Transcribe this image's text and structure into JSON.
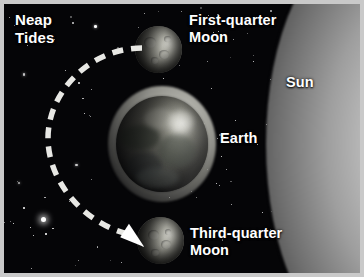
{
  "figure": {
    "title": "Neap Tides",
    "border_color": "#c9c9c9",
    "background_color": "#050507"
  },
  "labels": {
    "neap_tides": "Neap\nTides",
    "first_quarter_moon": "First-quarter\nMoon",
    "sun": "Sun",
    "earth": "Earth",
    "third_quarter_moon": "Third-quarter\nMoon",
    "text_color": "#ffffff"
  },
  "bodies": {
    "sun": {
      "name": "Sun",
      "position": "right-edge",
      "appearance": "bright-limb-gradient",
      "color": "#d8d8d8"
    },
    "earth": {
      "name": "Earth",
      "position": "center",
      "appearance": "globe-with-tidal-bulge-ring",
      "bulge_color": "#a8a8a0",
      "globe_color": "#6e6e66"
    },
    "first_quarter_moon": {
      "name": "First-quarter Moon",
      "position": "above-earth",
      "illuminated_side": "right",
      "color": "#c3c3b9"
    },
    "third_quarter_moon": {
      "name": "Third-quarter Moon",
      "position": "below-earth",
      "illuminated_side": "right",
      "color": "#c3c3b9"
    }
  },
  "orbit": {
    "style": "dashed-arc",
    "color": "#e8e8e4",
    "direction": "counterclockwise",
    "arrow_at": "third-quarter-moon",
    "dash_pattern": "11 8"
  },
  "starfield": {
    "color": "#ffffff",
    "count": 120
  }
}
